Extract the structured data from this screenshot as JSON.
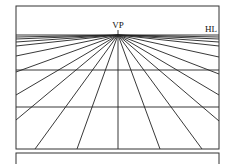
{
  "diagram": {
    "labels": {
      "vanishing_point": "VP",
      "horizon_line": "HL"
    },
    "frame": {
      "x": 16,
      "y": 6,
      "width": 203,
      "height": 143
    },
    "horizon_y": 35,
    "vanishing_point": {
      "x": 118,
      "y": 35
    },
    "ground_lines_y": [
      70,
      107
    ],
    "ray_endpoints": [
      [
        35,
        149
      ],
      [
        77,
        149
      ],
      [
        118,
        149
      ],
      [
        160,
        149
      ],
      [
        202,
        149
      ],
      [
        16,
        120
      ],
      [
        16,
        95
      ],
      [
        16,
        72
      ],
      [
        16,
        56
      ],
      [
        16,
        46
      ],
      [
        16,
        42
      ],
      [
        16,
        39
      ],
      [
        16,
        37
      ],
      [
        219,
        121
      ],
      [
        219,
        95
      ],
      [
        219,
        74
      ],
      [
        219,
        57
      ],
      [
        219,
        46
      ],
      [
        219,
        42
      ],
      [
        219,
        39
      ],
      [
        219,
        37
      ]
    ],
    "second_panel": {
      "x": 16,
      "y": 153,
      "width": 203,
      "height": 20
    }
  }
}
